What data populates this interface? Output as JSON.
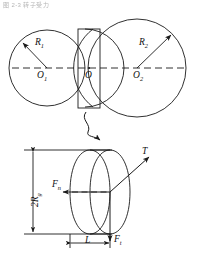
{
  "figure": {
    "header_text": "图 2-3  转子受力",
    "title": "",
    "caption": ""
  },
  "top_view": {
    "name": "two-intersecting-circles",
    "description": "Two overlapping circles with a rectangle bounding the lens-shaped intersection",
    "circles": [
      {
        "id": "left",
        "cx": 47,
        "cy": 68,
        "r": 38,
        "center_label": "O",
        "center_sub": "1",
        "radius_label": "R",
        "radius_sub": "1"
      },
      {
        "id": "right",
        "cx": 137,
        "cy": 68,
        "r": 49,
        "center_label": "O",
        "center_sub": "2",
        "radius_label": "R",
        "radius_sub": "2"
      }
    ],
    "intersection": {
      "center_label": "O",
      "rect": {
        "x": 78,
        "y": 29,
        "w": 22,
        "h": 79
      }
    },
    "centerline": {
      "style": "dashed",
      "from_x": 12,
      "to_x": 186,
      "y": 68
    },
    "radius_arrows": [
      {
        "for": "left",
        "from": [
          47,
          68
        ],
        "to": [
          22,
          42
        ]
      },
      {
        "for": "right",
        "from": [
          137,
          68
        ],
        "to": [
          172,
          34
        ]
      }
    ]
  },
  "connector": {
    "name": "squiggle-arrow",
    "description": "curved arrow linking the intersection region to the detail view"
  },
  "detail_view": {
    "name": "cylinder-free-body",
    "description": "Cylindrical contact element shown in perspective with applied forces",
    "labels": {
      "height": "2R",
      "height_sub": "g",
      "length": "L",
      "torque": "T",
      "force_normal": "F",
      "force_normal_sub": "n",
      "force_tangential": "F",
      "force_tangential_sub": "t"
    },
    "dimensions": {
      "height_line": {
        "x": 33,
        "y1": 150,
        "y2": 234
      },
      "length_line": {
        "y": 243,
        "x1": 70,
        "x2": 110
      }
    },
    "forces": [
      {
        "id": "normal",
        "label": "F",
        "sub": "n",
        "direction": "left",
        "from": [
          110,
          192
        ],
        "to": [
          62,
          192
        ]
      },
      {
        "id": "tangential",
        "label": "F",
        "sub": "t",
        "direction": "down",
        "from": [
          110,
          192
        ],
        "to": [
          110,
          240
        ]
      },
      {
        "id": "torque",
        "label": "T",
        "sub": "",
        "direction": "up-right",
        "from": [
          110,
          192
        ],
        "to": [
          150,
          156
        ]
      }
    ]
  },
  "style": {
    "stroke": "#1a1a1a",
    "background": "#ffffff",
    "line_width": 0.9
  }
}
